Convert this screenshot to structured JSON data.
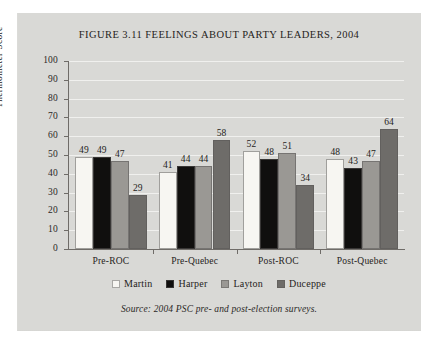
{
  "figure": {
    "title": "FIGURE 3.11 FEELINGS ABOUT PARTY LEADERS, 2004",
    "source": "Source: 2004 PSC pre- and post-election surveys."
  },
  "chart_data": {
    "type": "bar",
    "title": "FIGURE 3.11 FEELINGS ABOUT PARTY LEADERS, 2004",
    "xlabel": "",
    "ylabel": "Thermometer Score",
    "ylim": [
      0,
      100
    ],
    "ytick_step": 10,
    "yticks": [
      100,
      90,
      80,
      70,
      60,
      50,
      40,
      30,
      20,
      10,
      0
    ],
    "grid": true,
    "legend_position": "bottom",
    "categories": [
      "Pre-ROC",
      "Pre-Quebec",
      "Post-ROC",
      "Post-Quebec"
    ],
    "series": [
      {
        "name": "Martin",
        "color": "#f7f6f2",
        "values": [
          49,
          41,
          52,
          48
        ]
      },
      {
        "name": "Harper",
        "color": "#100f0e",
        "values": [
          49,
          44,
          48,
          43
        ]
      },
      {
        "name": "Layton",
        "color": "#9a9894",
        "values": [
          47,
          44,
          51,
          47
        ]
      },
      {
        "name": "Duceppe",
        "color": "#6e6c69",
        "values": [
          29,
          58,
          34,
          64
        ]
      }
    ],
    "annotations": [
      "Source: 2004 PSC pre- and post-election surveys."
    ]
  },
  "colors": {
    "panel_background": "#d9d9d6",
    "page_background": "#ffffff",
    "axis": "#6f6c68",
    "gridline": "#f0f0ee",
    "text": "#262321"
  }
}
